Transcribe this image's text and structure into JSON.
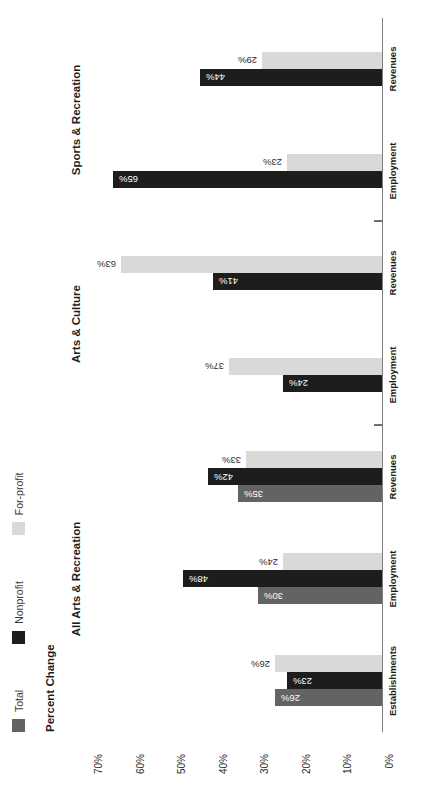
{
  "chart_data": {
    "type": "bar",
    "title": "",
    "ylabel": "Percent Change",
    "xlabel": "",
    "ylim": [
      0,
      70
    ],
    "grid": false,
    "legend_position": "top-left",
    "orientation": "rotated-90-ccw",
    "tick_labels": [
      "0%",
      "10%",
      "20%",
      "30%",
      "40%",
      "50%",
      "60%",
      "70%"
    ],
    "tick_values": [
      0,
      10,
      20,
      30,
      40,
      50,
      60,
      70
    ],
    "series": [
      {
        "name": "Total",
        "color": "#636363"
      },
      {
        "name": "Nonprofit",
        "color": "#1d1d1d"
      },
      {
        "name": "For-profit",
        "color": "#d9d9d9"
      }
    ],
    "groups": [
      {
        "name": "All Arts & Recreation",
        "categories": [
          {
            "label": "Establishments",
            "values": [
              26,
              23,
              26
            ],
            "labels": [
              "26%",
              "23%",
              "26%"
            ]
          },
          {
            "label": "Employment",
            "values": [
              30,
              48,
              24
            ],
            "labels": [
              "30%",
              "48%",
              "24%"
            ]
          },
          {
            "label": "Revenues",
            "values": [
              35,
              42,
              33
            ],
            "labels": [
              "35%",
              "42%",
              "33%"
            ]
          }
        ]
      },
      {
        "name": "Arts & Culture",
        "categories": [
          {
            "label": "Employment",
            "values": [
              null,
              24,
              37
            ],
            "labels": [
              null,
              "24%",
              "37%"
            ]
          },
          {
            "label": "Revenues",
            "values": [
              null,
              41,
              63
            ],
            "labels": [
              null,
              "41%",
              "63%"
            ]
          }
        ]
      },
      {
        "name": "Sports & Recreation",
        "categories": [
          {
            "label": "Employment",
            "values": [
              null,
              65,
              23
            ],
            "labels": [
              null,
              "65%",
              "23%"
            ]
          },
          {
            "label": "Revenues",
            "values": [
              null,
              44,
              29
            ],
            "labels": [
              null,
              "44%",
              "29%"
            ]
          }
        ]
      }
    ]
  },
  "legend": {
    "items": [
      {
        "label": "Total",
        "color": "#636363"
      },
      {
        "label": "Nonprofit",
        "color": "#1d1d1d"
      },
      {
        "label": "For-profit",
        "color": "#d9d9d9"
      }
    ]
  },
  "axis": {
    "title": "Percent Change"
  },
  "colors": {
    "background": "#ffffff",
    "axis_line": "#7d7d7d",
    "text": "#1d1d1d",
    "total": "#636363",
    "nonprofit": "#1d1d1d",
    "forprofit": "#d9d9d9"
  }
}
